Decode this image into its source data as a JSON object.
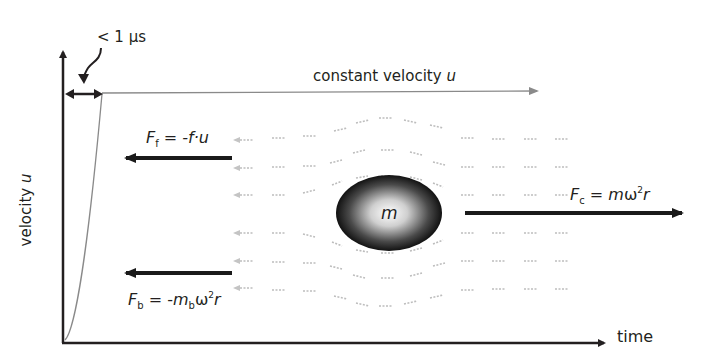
{
  "diagram": {
    "axes": {
      "y_label_text": "velocity ",
      "y_label_var": "u",
      "x_label": "time"
    },
    "annotations": {
      "time_scale": "< 1 µs",
      "constant_velocity_text": "constant velocity ",
      "constant_velocity_var": "u"
    },
    "mass": {
      "label": "m"
    },
    "forces": {
      "friction": {
        "F": "F",
        "sub": "f",
        "rhs": " = -f·u"
      },
      "buoyancy": {
        "F": "F",
        "sub": "b",
        "eq": " = -",
        "m": "m",
        "msub": "b",
        "omega": "ω",
        "sup": "2",
        "r": "r"
      },
      "centrifugal": {
        "F": "F",
        "sub": "c",
        "eq": " = ",
        "m": "m",
        "omega": "ω",
        "sup": "2",
        "r": "r"
      }
    },
    "colors": {
      "axis": "#231f20",
      "curve": "#8a8a8a",
      "force_arrow": "#1a1a1a",
      "flow_text": "#b5b5b5"
    }
  }
}
